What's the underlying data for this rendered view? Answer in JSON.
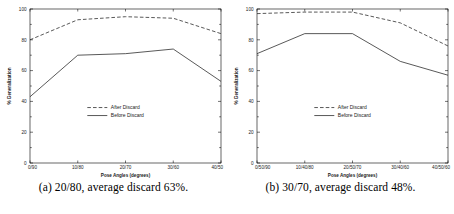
{
  "figure": {
    "panels": [
      {
        "id": "panel-a",
        "caption": "(a) 20/80, average discard 63%.",
        "chart_data": {
          "type": "line",
          "title": "",
          "xlabel": "Pose Angles (degrees)",
          "ylabel": "% Generalization",
          "categories": [
            "0/90",
            "10/80",
            "20/70",
            "30/60",
            "40/50"
          ],
          "yticks": [
            0,
            20,
            40,
            60,
            80,
            100
          ],
          "ylim": [
            0,
            100
          ],
          "grid": false,
          "legend_position": "center",
          "series": [
            {
              "name": "After Discard",
              "style": "dashed",
              "values": [
                80,
                93,
                95,
                94,
                84
              ]
            },
            {
              "name": "Before Discard",
              "style": "solid",
              "values": [
                43,
                70,
                71,
                74,
                53
              ]
            }
          ]
        }
      },
      {
        "id": "panel-b",
        "caption": "(b) 30/70, average discard 48%.",
        "chart_data": {
          "type": "line",
          "title": "",
          "xlabel": "Pose Angles (degrees)",
          "ylabel": "% Generalization",
          "categories": [
            "0/50/90",
            "10/40/80",
            "20/50/70",
            "30/40/60",
            "40/50/60"
          ],
          "yticks": [
            0,
            20,
            40,
            60,
            80,
            100
          ],
          "ylim": [
            0,
            100
          ],
          "grid": false,
          "legend_position": "center",
          "series": [
            {
              "name": "After Discard",
              "style": "dashed",
              "values": [
                97,
                98,
                98,
                91,
                76
              ]
            },
            {
              "name": "Before Discard",
              "style": "solid",
              "values": [
                71,
                84,
                84,
                66,
                57
              ]
            }
          ]
        }
      }
    ],
    "colors": {
      "line": "#222222",
      "axis": "#000000",
      "text": "#1a1a1a",
      "background": "#ffffff"
    }
  }
}
